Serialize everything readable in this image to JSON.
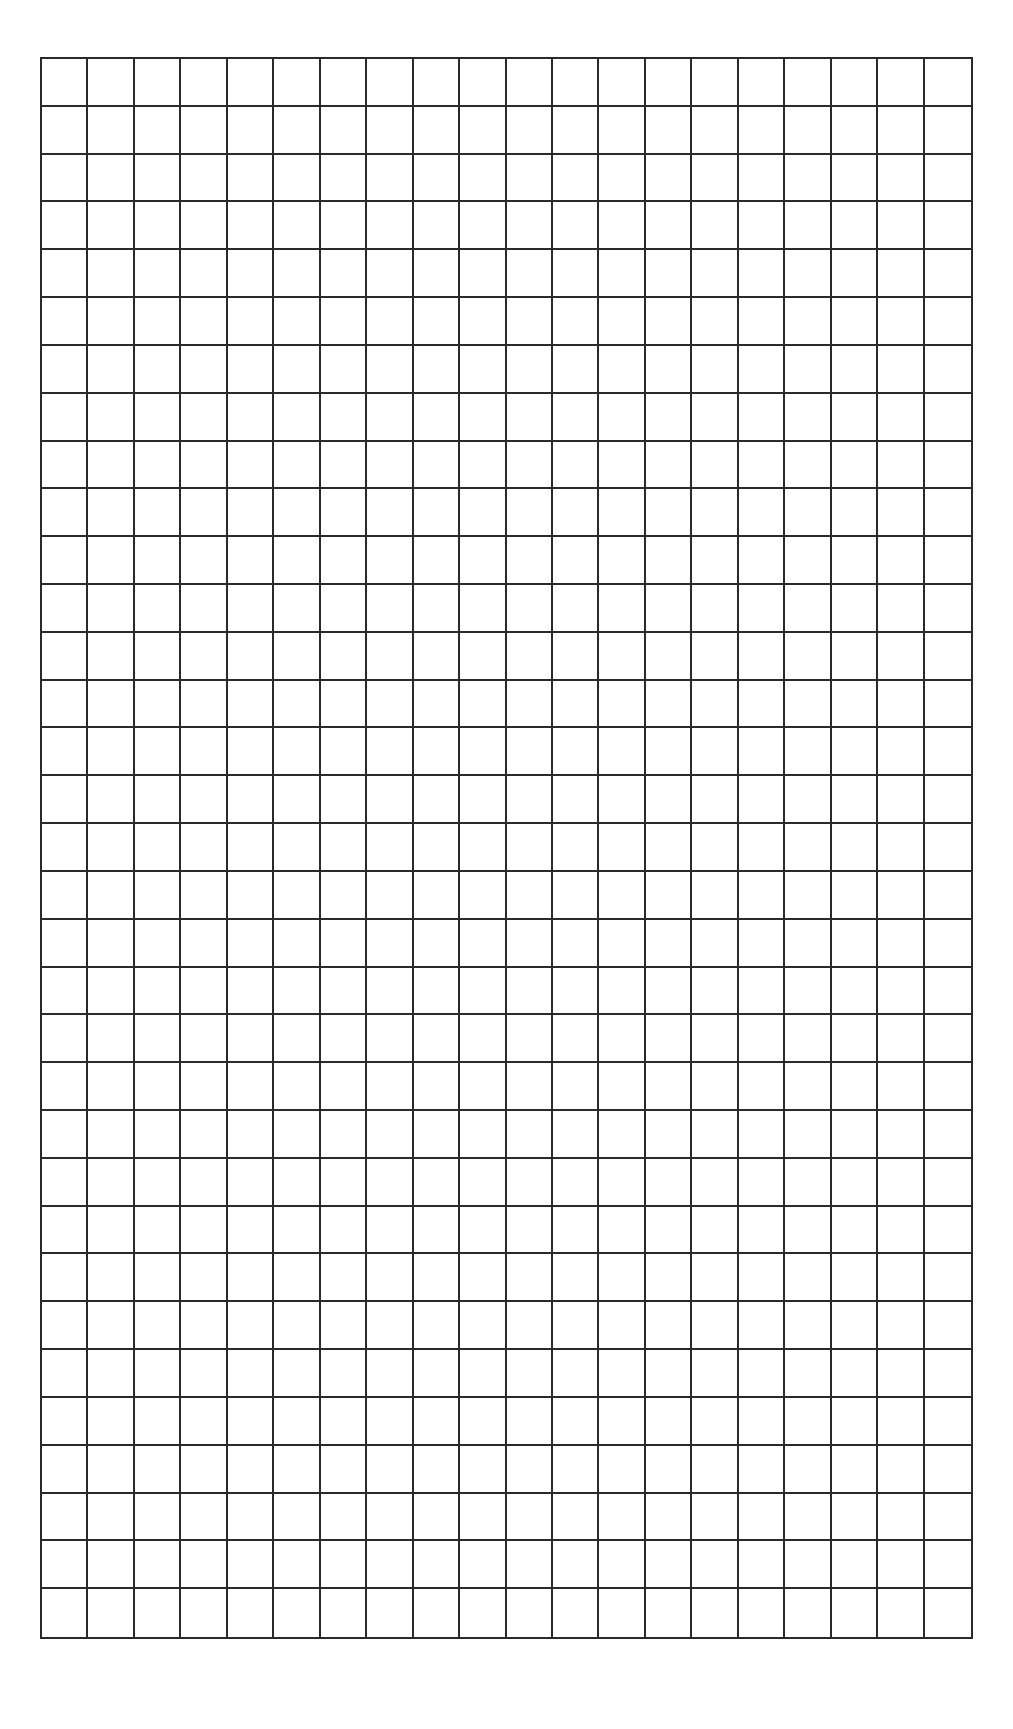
{
  "page": {
    "background_color": "#ffffff"
  },
  "grid": {
    "columns": 20,
    "rows": 33,
    "line_color": "#2a2a2a",
    "left": 40,
    "top": 57,
    "width": 933,
    "height": 1582
  }
}
